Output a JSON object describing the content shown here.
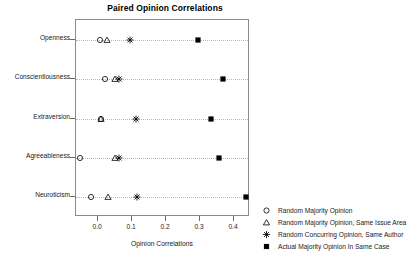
{
  "chart_data": {
    "type": "scatter",
    "title": "Paired Opinion Correlations",
    "xlabel": "Opinion Correlations",
    "ylabel": "",
    "grid": true,
    "legend_position": "right",
    "xlim": [
      -0.065,
      0.447
    ],
    "xticks": [
      0.0,
      0.1,
      0.2,
      0.3,
      0.4
    ],
    "xtick_labels": [
      "0.0",
      "0.1",
      "0.2",
      "0.3",
      "0.4"
    ],
    "categories": [
      "Openness",
      "Conscientiousness",
      "Extraversion",
      "Agreeableness",
      "Neuroticism"
    ],
    "series": [
      {
        "name": "Random Majority Opinion",
        "marker": "open-circle",
        "values": [
          0.006,
          0.021,
          0.009,
          -0.053,
          -0.021
        ]
      },
      {
        "name": "Random Majority Opinion, Same Issue Area",
        "marker": "open-triangle",
        "values": [
          0.026,
          0.05,
          0.009,
          0.05,
          0.029
        ]
      },
      {
        "name": "Random Concurring Opinion, Same Author",
        "marker": "asterisk",
        "values": [
          0.094,
          0.062,
          0.112,
          0.062,
          0.115
        ]
      },
      {
        "name": "Actual Majority Opinion In Same Case",
        "marker": "filled-square",
        "values": [
          0.294,
          0.368,
          0.332,
          0.356,
          0.435
        ]
      }
    ]
  },
  "legend": {
    "entries": [
      {
        "label": "Random Majority Opinion",
        "marker": "open-circle"
      },
      {
        "label": "Random Majority Opinion, Same Issue Area",
        "marker": "open-triangle"
      },
      {
        "label": "Random Concurring Opinion, Same Author",
        "marker": "asterisk"
      },
      {
        "label": "Actual Majority Opinion In Same Case",
        "marker": "filled-square"
      }
    ]
  },
  "colors": {
    "marker": "#000000",
    "frame": "#8a8a8a",
    "grid": "#b8b8b8",
    "background": "#ffffff"
  }
}
